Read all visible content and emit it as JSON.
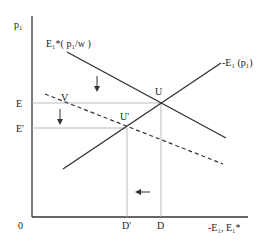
{
  "diagram": {
    "type": "economics-supply-demand-shift",
    "axes": {
      "y_label": "p₁",
      "x_label": "-E₁, E₁*",
      "origin_label": "0"
    },
    "curves": {
      "demand": {
        "label": "E₁*( p₁/w )",
        "style": "solid"
      },
      "supply": {
        "label": "-E₁ (p₁)",
        "style": "solid"
      },
      "shifted": {
        "label": "",
        "style": "dashed"
      }
    },
    "points": {
      "U": "U",
      "U_prime": "U'",
      "V": "V"
    },
    "y_ticks": {
      "E": "E",
      "E_prime": "E'"
    },
    "x_ticks": {
      "D": "D",
      "D_prime": "D'"
    },
    "arrows": [
      "down",
      "down",
      "left"
    ],
    "colors": {
      "line": "#333333",
      "guide": "#aaaaaa"
    }
  }
}
